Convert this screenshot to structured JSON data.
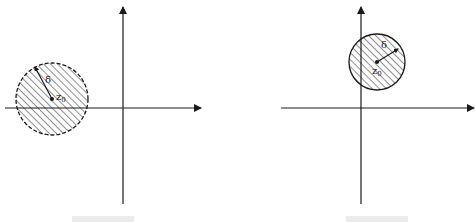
{
  "figures": [
    {
      "name": "left",
      "circle_style": "dashed",
      "center_label": "z",
      "center_subscript": "0",
      "radius_label": "δ",
      "description": "Disk of radius δ centered at z0 in the left half-plane, intersecting the real axis"
    },
    {
      "name": "right",
      "circle_style": "solid",
      "center_label": "z",
      "center_subscript": "0",
      "radius_label": "δ",
      "description": "Disk of radius δ centered at z0 in the upper half-plane, intersecting the imaginary axis"
    }
  ],
  "colors": {
    "ink": "#1a1a1a",
    "background": "#ffffff"
  }
}
